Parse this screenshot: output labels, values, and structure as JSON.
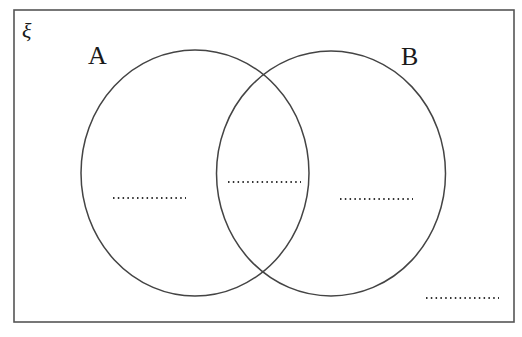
{
  "diagram": {
    "type": "venn",
    "universal_set_symbol": "ξ",
    "sets": [
      {
        "label": "A",
        "region_placeholder": "..............."
      },
      {
        "label": "B",
        "region_placeholder": "..............."
      }
    ],
    "intersection_placeholder": "...............",
    "outside_placeholder": "...............",
    "colors": {
      "stroke": "#444444",
      "text": "#1a1a1a",
      "background": "#ffffff"
    }
  }
}
